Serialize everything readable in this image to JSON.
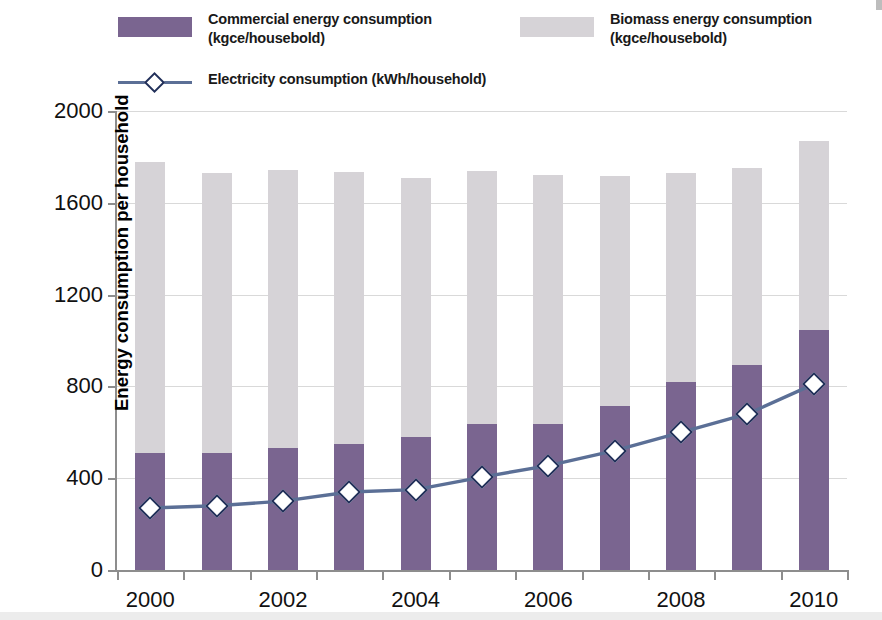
{
  "chart_data": {
    "type": "bar",
    "title": "",
    "subtitle": "",
    "xlabel": "",
    "ylabel": "Energy consumption per household",
    "ylim": [
      0,
      2000
    ],
    "yticks": [
      0,
      400,
      800,
      1200,
      1600,
      2000
    ],
    "ytick_labels": [
      "0",
      "400",
      "800",
      "1200",
      "1600",
      "2000"
    ],
    "grid": true,
    "legend_position": "top",
    "stacked": true,
    "categories": [
      2000,
      2001,
      2002,
      2003,
      2004,
      2005,
      2006,
      2007,
      2008,
      2009,
      2010
    ],
    "xtick_labels": [
      "2000",
      "2002",
      "2004",
      "2006",
      "2008",
      "2010"
    ],
    "xticks_shown": [
      2000,
      2002,
      2004,
      2006,
      2008,
      2010
    ],
    "series": [
      {
        "name": "Commercial energy consumption  (kgce/housebold)",
        "type": "bar",
        "stack": "total",
        "color": "#7a6590",
        "values": [
          510,
          510,
          530,
          550,
          580,
          635,
          635,
          715,
          820,
          895,
          1045
        ]
      },
      {
        "name": "Biomass energy consumption  (kgce/housebold)",
        "type": "bar",
        "stack": "total",
        "color": "#d6d3d7",
        "values": [
          1270,
          1220,
          1215,
          1185,
          1130,
          1105,
          1085,
          1000,
          910,
          855,
          825
        ]
      },
      {
        "name": "Electricity consumption  (kWh/household)",
        "type": "line",
        "color": "#5b6f96",
        "marker": "diamond",
        "marker_face": "#ffffff",
        "marker_edge": "#22305a",
        "values": [
          270,
          280,
          300,
          340,
          350,
          405,
          455,
          520,
          600,
          680,
          810
        ]
      }
    ],
    "stack_totals": [
      1780,
      1730,
      1745,
      1735,
      1710,
      1740,
      1720,
      1715,
      1730,
      1750,
      1870
    ]
  },
  "legend": {
    "items": [
      {
        "key": "commercial",
        "swatch": "bar-swatch-purple",
        "line1": "Commercial energy consumption",
        "line2": "(kgce/housebold)",
        "label": "Commercial energy consumption\n (kgce/housebold)",
        "color": "#7a6590"
      },
      {
        "key": "biomass",
        "swatch": "bar-swatch-grey",
        "line1": "Biomass energy consumption",
        "line2": "(kgce/housebold)",
        "label": "Biomass energy consumption\n (kgce/housebold)",
        "color": "#d6d3d7"
      },
      {
        "key": "electricity",
        "swatch": "line-marker-diamond",
        "line1": "Electricity consumption  (kWh/household)",
        "line2": "",
        "label": "Electricity consumption  (kWh/household)",
        "color": "#5b6f96"
      }
    ]
  },
  "axes": {
    "y_title": "Energy consumption per household",
    "y_labels": [
      "2000",
      "1600",
      "1200",
      "800",
      "400",
      "0"
    ],
    "x_labels": [
      "2000",
      "2002",
      "2004",
      "2006",
      "2008",
      "2010"
    ]
  },
  "colors": {
    "commercial": "#7a6590",
    "biomass": "#d6d3d7",
    "electricity_line": "#5b6f96",
    "marker_edge": "#22305a",
    "axis": "#8d8d8d",
    "grid": "#d9d9d9",
    "text": "#111111",
    "background": "#ffffff"
  }
}
